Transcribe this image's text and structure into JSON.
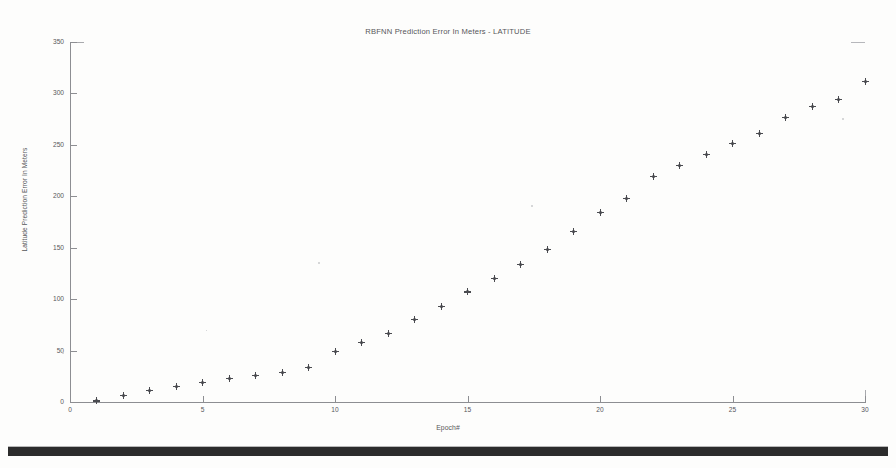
{
  "document": {
    "background_color": "#fdfdfc",
    "ink_color": "#4a4b50",
    "footer_bar_color": "#1b1b1b"
  },
  "chart_data": {
    "type": "scatter",
    "title": "RBFNN Prediction Error In Meters - LATITUDE",
    "subtitle": "",
    "xlabel": "Epoch#",
    "ylabel": "Latitude Prediction Error In Meters",
    "xlim": [
      0,
      30
    ],
    "ylim": [
      0,
      350
    ],
    "xticks": [
      0,
      5,
      10,
      15,
      20,
      25,
      30
    ],
    "yticks": [
      0,
      50,
      100,
      150,
      200,
      250,
      300,
      350
    ],
    "grid": false,
    "legend": null,
    "marker": "plus-star",
    "marker_color": "#4a4b50",
    "series": [
      {
        "name": "Latitude Prediction Error",
        "x": [
          1,
          2,
          3,
          4,
          5,
          6,
          7,
          8,
          9,
          10,
          11,
          12,
          13,
          14,
          15,
          16,
          17,
          18,
          19,
          20,
          21,
          22,
          23,
          24,
          25,
          26,
          27,
          28,
          29,
          30
        ],
        "values": [
          1,
          6,
          11,
          15,
          19,
          23,
          26,
          29,
          34,
          49,
          58,
          67,
          80,
          93,
          107,
          120,
          134,
          148,
          166,
          184,
          198,
          219,
          230,
          241,
          251,
          261,
          277,
          287,
          294,
          312
        ]
      }
    ]
  },
  "axis_labels": {
    "y": [
      "350",
      "300",
      "250",
      "200",
      "150",
      "100",
      "50",
      "0"
    ],
    "x": [
      "0",
      "5",
      "10",
      "15",
      "20",
      "25",
      "30"
    ]
  }
}
